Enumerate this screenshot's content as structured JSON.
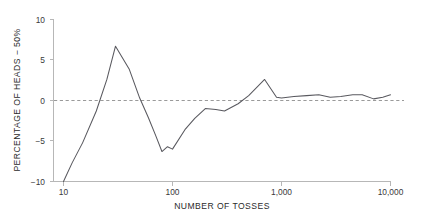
{
  "chart_data": {
    "type": "line",
    "title": "",
    "subtitle": "",
    "xlabel": "NUMBER OF TOSSES",
    "ylabel": "PERCENTAGE OF HEADS − 50%",
    "xscale": "log",
    "yscale": "linear",
    "xlim": [
      10,
      10000
    ],
    "ylim": [
      -10,
      10
    ],
    "grid": false,
    "legend": null,
    "legend_position": "none",
    "annotations": [
      {
        "text": "zero reference line at y = 0",
        "style": "dashed-gray-horizontal"
      }
    ],
    "xticks": [
      10,
      100,
      1000,
      10000
    ],
    "xtick_labels": [
      "10",
      "100",
      "1,000",
      "10,000"
    ],
    "yticks": [
      -10,
      -5,
      0,
      5,
      10
    ],
    "ytick_labels": [
      "−10",
      "−5",
      "0",
      "5",
      "10"
    ],
    "series": [
      {
        "name": "percentage of heads minus 50%",
        "color": "#59595f",
        "x": [
          10,
          12,
          15,
          20,
          25,
          30,
          40,
          50,
          60,
          70,
          80,
          90,
          100,
          130,
          160,
          200,
          250,
          300,
          400,
          500,
          700,
          900,
          1000,
          1300,
          1700,
          2200,
          2800,
          3500,
          4500,
          5500,
          7000,
          8500,
          10000
        ],
        "values": [
          -10.0,
          -7.7,
          -5.2,
          -1.3,
          2.6,
          6.7,
          3.9,
          0.3,
          -2.1,
          -4.3,
          -6.3,
          -5.7,
          -6.0,
          -3.6,
          -2.2,
          -1.0,
          -1.1,
          -1.3,
          -0.4,
          0.6,
          2.6,
          0.4,
          0.3,
          0.5,
          0.6,
          0.7,
          0.4,
          0.5,
          0.7,
          0.7,
          0.2,
          0.4,
          0.7
        ]
      }
    ]
  },
  "axes": {
    "x_title": "NUMBER OF TOSSES",
    "y_title": "PERCENTAGE OF HEADS − 50%",
    "x_tick_0": "10",
    "x_tick_1": "100",
    "x_tick_2": "1,000",
    "x_tick_3": "10,000",
    "y_tick_0": "10",
    "y_tick_1": "5",
    "y_tick_2": "0",
    "y_tick_3": "−5",
    "y_tick_4": "−10"
  },
  "colors": {
    "background": "#ffffff",
    "data_line": "#59595f",
    "axis": "#b7b7b7",
    "zero_line": "#9a9a9a",
    "text": "#2b2b2b"
  }
}
